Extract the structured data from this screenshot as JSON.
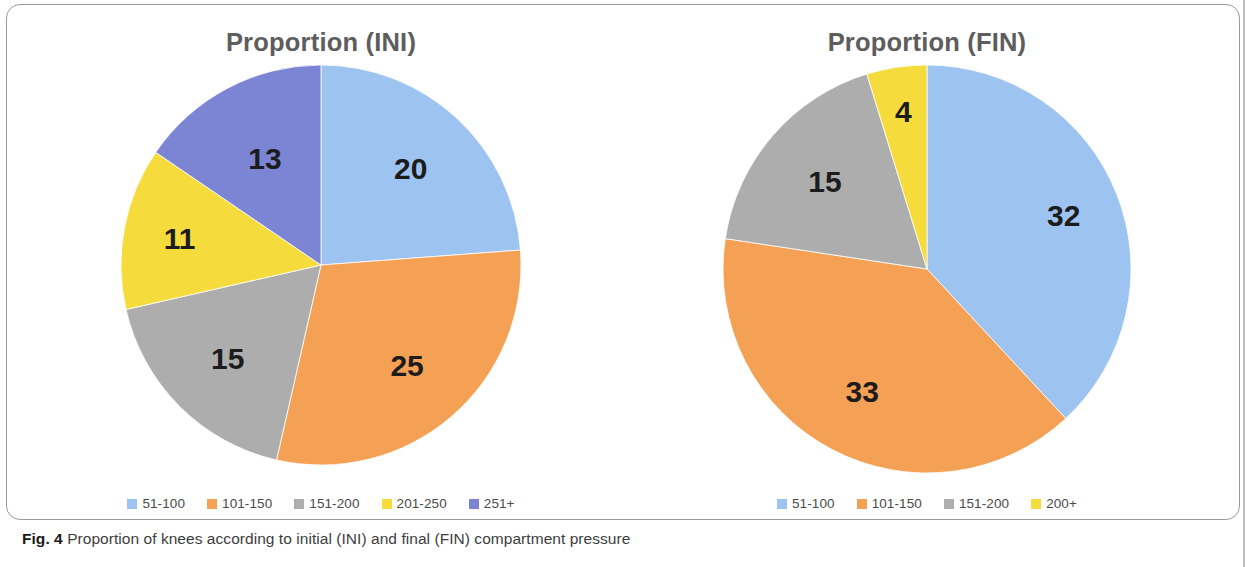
{
  "figure": {
    "caption_lead": "Fig. 4",
    "caption_text": "Proportion of knees according to initial (INI) and final (FIN) compartment pressure"
  },
  "colors": {
    "blue": "#9dc3f0",
    "orange": "#f4a055",
    "gray": "#adadad",
    "yellow": "#f5dc3c",
    "purple": "#7b85d4",
    "title_text": "#5d5d5d",
    "label_text": "#1c1c1c",
    "legend_text": "#4a4a4a",
    "frame_border": "#9a9a9a"
  },
  "panels": [
    {
      "id": "ini",
      "title": "Proportion (INI)",
      "legend": [
        {
          "label": "51-100",
          "color": "#9dc3f0"
        },
        {
          "label": "101-150",
          "color": "#f4a055"
        },
        {
          "label": "151-200",
          "color": "#adadad"
        },
        {
          "label": "201-250",
          "color": "#f5dc3c"
        },
        {
          "label": "251+",
          "color": "#7b85d4"
        }
      ]
    },
    {
      "id": "fin",
      "title": "Proportion (FIN)",
      "legend": [
        {
          "label": "51-100",
          "color": "#9dc3f0"
        },
        {
          "label": "101-150",
          "color": "#f4a055"
        },
        {
          "label": "151-200",
          "color": "#adadad"
        },
        {
          "label": "200+",
          "color": "#f5dc3c"
        }
      ]
    }
  ],
  "chart_data": [
    {
      "type": "pie",
      "title": "Proportion (INI)",
      "categories": [
        "51-100",
        "101-150",
        "151-200",
        "201-250",
        "251+"
      ],
      "values": [
        20,
        25,
        15,
        11,
        13
      ],
      "labels": [
        "20",
        "25",
        "15",
        "11",
        "13"
      ],
      "colors": [
        "#9dc3f0",
        "#f4a055",
        "#adadad",
        "#f5dc3c",
        "#7b85d4"
      ],
      "total": 84,
      "start_angle_deg": 0,
      "direction": "clockwise",
      "legend_position": "bottom",
      "xlabel": "",
      "ylabel": ""
    },
    {
      "type": "pie",
      "title": "Proportion (FIN)",
      "categories": [
        "51-100",
        "101-150",
        "151-200",
        "200+"
      ],
      "values": [
        32,
        33,
        15,
        4
      ],
      "labels": [
        "32",
        "33",
        "15",
        "4"
      ],
      "colors": [
        "#9dc3f0",
        "#f4a055",
        "#adadad",
        "#f5dc3c"
      ],
      "total": 84,
      "start_angle_deg": 0,
      "direction": "clockwise",
      "legend_position": "bottom",
      "xlabel": "",
      "ylabel": ""
    }
  ]
}
